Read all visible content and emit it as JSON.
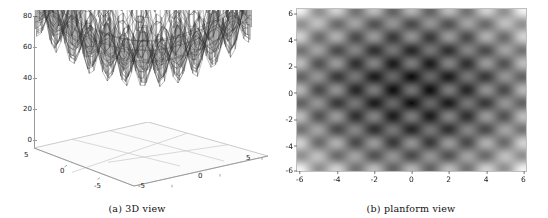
{
  "figure": {
    "panels": [
      {
        "id": "a",
        "caption": "(a) 3D view"
      },
      {
        "id": "b",
        "caption": "(b) planform view"
      }
    ]
  },
  "plot3d": {
    "z_ticks": [
      "80",
      "60",
      "40",
      "20",
      "0"
    ],
    "z_values": [
      80,
      60,
      40,
      20,
      0
    ],
    "left_axis_ticks": [
      "5",
      "0",
      "-5"
    ],
    "right_axis_ticks": [
      "-5",
      "0",
      "5"
    ],
    "mesh_color": "#2b2b2b",
    "axis_color": "#9a9a9a"
  },
  "planform": {
    "x_ticks": [
      "-6",
      "-4",
      "-2",
      "0",
      "2",
      "4",
      "6"
    ],
    "y_ticks": [
      "6",
      "4",
      "2",
      "0",
      "-2",
      "-4",
      "-6"
    ],
    "low_color": "#111111",
    "high_color": "#f2f2f0"
  },
  "chart_data": [
    {
      "type": "surface",
      "title": "(a) 3D view",
      "xlabel": "",
      "ylabel": "",
      "zlabel": "",
      "xlim": [
        -6,
        6
      ],
      "ylim": [
        -6,
        6
      ],
      "zlim": [
        0,
        80
      ],
      "x_tick_values": [
        -5,
        0,
        5
      ],
      "y_tick_values": [
        -5,
        0,
        5
      ],
      "z_tick_values": [
        0,
        20,
        40,
        60,
        80
      ],
      "grid": true,
      "legend": "none",
      "description": "Highly multimodal wireframe surface with a regular lattice of peaks and valleys; basin-like depression toward the centre and raised values near the domain edges.",
      "function_family": "multimodal-periodic",
      "peak_value": 85,
      "valley_value": 0,
      "center_valley_value": 40
    },
    {
      "type": "heatmap",
      "title": "(b) planform view",
      "xlabel": "",
      "ylabel": "",
      "xlim": [
        -6.2,
        6.2
      ],
      "ylim": [
        -6.2,
        6.2
      ],
      "x_tick_values": [
        -6,
        -4,
        -2,
        0,
        2,
        4,
        6
      ],
      "y_tick_values": [
        6,
        4,
        2,
        0,
        -2,
        -4,
        -6
      ],
      "grid": false,
      "legend": "none",
      "colormap": "grayscale-inverted",
      "vmin": 0,
      "vmax": 80,
      "description": "Periodic lattice of dark minima spaced about 2 units apart in x and y; darkest global minima clustered at the four corners near (-5,5), (5,5), (-5,-5), (5,-5), with a prominent dark spot at the origin.",
      "lattice_spacing": 2.0,
      "minima": [
        {
          "x": -5,
          "y": 5,
          "intensity": 1.0
        },
        {
          "x": 5,
          "y": 5,
          "intensity": 1.0
        },
        {
          "x": -5,
          "y": -5,
          "intensity": 1.0
        },
        {
          "x": 5,
          "y": -5,
          "intensity": 1.0
        },
        {
          "x": 0,
          "y": 0,
          "intensity": 0.92
        },
        {
          "x": -2,
          "y": 0,
          "intensity": 0.72
        },
        {
          "x": 2,
          "y": 0,
          "intensity": 0.72
        },
        {
          "x": 0,
          "y": 2,
          "intensity": 0.72
        },
        {
          "x": 0,
          "y": -2,
          "intensity": 0.72
        },
        {
          "x": -2,
          "y": 2,
          "intensity": 0.62
        },
        {
          "x": 2,
          "y": 2,
          "intensity": 0.62
        },
        {
          "x": -2,
          "y": -2,
          "intensity": 0.62
        },
        {
          "x": 2,
          "y": -2,
          "intensity": 0.62
        }
      ]
    }
  ]
}
